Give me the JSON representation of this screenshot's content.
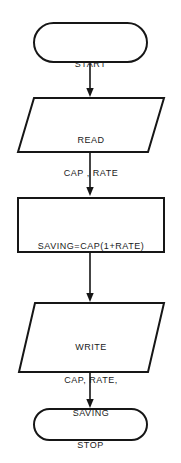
{
  "diagram": {
    "stroke_color": "#161616",
    "text_color": "#1a1a1a",
    "background_color": "#ffffff",
    "stroke_width": 2,
    "nodes": [
      {
        "id": "start",
        "shape": "terminator",
        "label": "START",
        "lines": [
          "START"
        ]
      },
      {
        "id": "read",
        "shape": "parallelogram",
        "label": "READ CAP , RATE",
        "lines": [
          "READ",
          "CAP , RATE"
        ],
        "line1": "READ",
        "line2": "CAP , RATE"
      },
      {
        "id": "process",
        "shape": "rectangle",
        "label": "SAVING=CAP(1+RATE)",
        "lines": [
          "SAVING=CAP(1+RATE)"
        ],
        "line1": "SAVING=CAP(1+RATE)"
      },
      {
        "id": "write",
        "shape": "parallelogram",
        "label": "WRITE CAP, RATE, SAVING",
        "lines": [
          "WRITE",
          "CAP, RATE,",
          "SAVING"
        ],
        "line1": "WRITE",
        "line2": "CAP, RATE,",
        "line3": "SAVING"
      },
      {
        "id": "stop",
        "shape": "terminator",
        "label": "STOP",
        "lines": [
          "STOP"
        ]
      }
    ],
    "connectors": [
      {
        "id": "start-to-read",
        "from": "start",
        "to": "read",
        "arrow": "down",
        "label": ""
      },
      {
        "id": "read-to-process",
        "from": "read",
        "to": "process",
        "arrow": "down",
        "label": ""
      },
      {
        "id": "process-to-write",
        "from": "process",
        "to": "write",
        "arrow": "down",
        "label": ""
      },
      {
        "id": "write-to-stop",
        "from": "write",
        "to": "stop",
        "arrow": "down",
        "label": ""
      }
    ]
  }
}
